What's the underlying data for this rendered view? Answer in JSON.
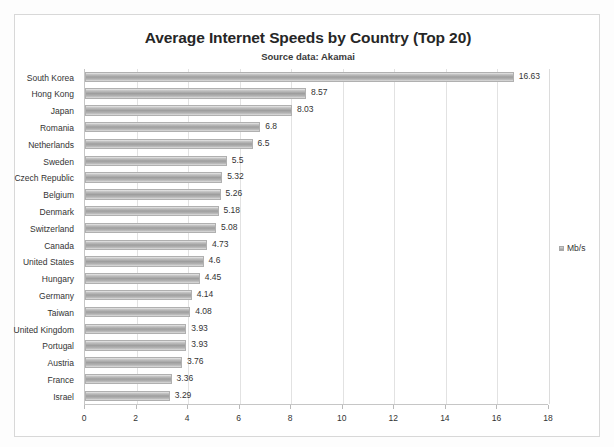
{
  "chart_data": {
    "type": "bar",
    "orientation": "horizontal",
    "title": "Average Internet Speeds by Country (Top 20)",
    "subtitle": "Source data: Akamai",
    "xlabel": "",
    "ylabel": "",
    "xlim": [
      0,
      18
    ],
    "xticks": [
      0,
      2,
      4,
      6,
      8,
      10,
      12,
      14,
      16,
      18
    ],
    "grid": "vertical",
    "legend": {
      "position": "right",
      "entries": [
        "Mb/s"
      ]
    },
    "series": [
      {
        "name": "Mb/s",
        "color": "#9e9e9e"
      }
    ],
    "categories": [
      "South Korea",
      "Hong Kong",
      "Japan",
      "Romania",
      "Netherlands",
      "Sweden",
      "Czech Republic",
      "Belgium",
      "Denmark",
      "Switzerland",
      "Canada",
      "United States",
      "Hungary",
      "Germany",
      "Taiwan",
      "United Kingdom",
      "Portugal",
      "Austria",
      "France",
      "Israel"
    ],
    "values": [
      16.63,
      8.57,
      8.03,
      6.8,
      6.5,
      5.5,
      5.32,
      5.26,
      5.18,
      5.08,
      4.73,
      4.6,
      4.45,
      4.14,
      4.08,
      3.93,
      3.93,
      3.76,
      3.36,
      3.29
    ],
    "value_labels": [
      "16.63",
      "8.57",
      "8.03",
      "6.8",
      "6.5",
      "5.5",
      "5.32",
      "5.26",
      "5.18",
      "5.08",
      "4.73",
      "4.6",
      "4.45",
      "4.14",
      "4.08",
      "3.93",
      "3.93",
      "3.76",
      "3.36",
      "3.29"
    ],
    "tick_labels": [
      "0",
      "2",
      "4",
      "6",
      "8",
      "10",
      "12",
      "14",
      "16",
      "18"
    ]
  }
}
